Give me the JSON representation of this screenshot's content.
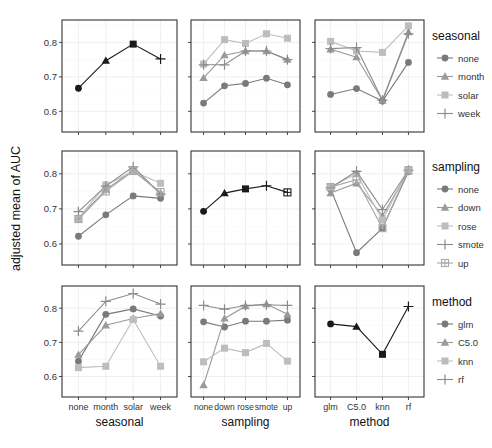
{
  "chart_data": {
    "type": "line",
    "title": "",
    "ylabel": "adjusted mean of AUC",
    "ylim": [
      0.54,
      0.865
    ],
    "yticks": [
      0.6,
      0.7,
      0.8
    ],
    "ytick_labels": [
      "0.6",
      "0.7",
      "0.8"
    ],
    "grid": true,
    "legend_position": "right",
    "factors": {
      "seasonal": [
        "none",
        "month",
        "solar",
        "week"
      ],
      "sampling": [
        "none",
        "down",
        "rose",
        "smote",
        "up"
      ],
      "method": [
        "glm",
        "C5.0",
        "knn",
        "rf"
      ]
    },
    "xlabels": [
      "seasonal",
      "sampling",
      "method"
    ],
    "legends": [
      {
        "title": "seasonal",
        "entries": [
          "none",
          "month",
          "solar",
          "week"
        ]
      },
      {
        "title": "sampling",
        "entries": [
          "none",
          "down",
          "rose",
          "smote",
          "up"
        ]
      },
      {
        "title": "method",
        "entries": [
          "glm",
          "C5.0",
          "knn",
          "rf"
        ]
      }
    ],
    "panels": [
      {
        "row": 0,
        "col": 0,
        "x_factor": "seasonal",
        "trace_factor": "seasonal",
        "main_effect": true,
        "series": [
          {
            "name": "main",
            "values": [
              0.667,
              0.747,
              0.795,
              0.752
            ]
          }
        ]
      },
      {
        "row": 0,
        "col": 1,
        "x_factor": "sampling",
        "trace_factor": "seasonal",
        "series": [
          {
            "name": "none",
            "values": [
              0.624,
              0.674,
              0.681,
              0.696,
              0.677
            ]
          },
          {
            "name": "month",
            "values": [
              0.697,
              0.763,
              0.775,
              0.775,
              0.75
            ]
          },
          {
            "name": "solar",
            "values": [
              0.737,
              0.808,
              0.797,
              0.825,
              0.812
            ]
          },
          {
            "name": "week",
            "values": [
              0.735,
              0.735,
              0.775,
              0.775,
              0.75
            ]
          }
        ]
      },
      {
        "row": 0,
        "col": 2,
        "x_factor": "method",
        "trace_factor": "seasonal",
        "series": [
          {
            "name": "none",
            "values": [
              0.649,
              0.666,
              0.63,
              0.742
            ]
          },
          {
            "name": "month",
            "values": [
              0.78,
              0.757,
              0.632,
              0.83
            ]
          },
          {
            "name": "solar",
            "values": [
              0.803,
              0.775,
              0.771,
              0.848
            ]
          },
          {
            "name": "week",
            "values": [
              0.782,
              0.785,
              0.632,
              0.825
            ]
          }
        ]
      },
      {
        "row": 1,
        "col": 0,
        "x_factor": "seasonal",
        "trace_factor": "sampling",
        "series": [
          {
            "name": "none",
            "values": [
              0.622,
              0.683,
              0.737,
              0.73
            ]
          },
          {
            "name": "down",
            "values": [
              0.672,
              0.755,
              0.81,
              0.745
            ]
          },
          {
            "name": "rose",
            "values": [
              0.673,
              0.768,
              0.807,
              0.773
            ]
          },
          {
            "name": "smote",
            "values": [
              0.692,
              0.765,
              0.82,
              0.742
            ]
          },
          {
            "name": "up",
            "values": [
              0.671,
              0.75,
              0.808,
              0.748
            ]
          }
        ]
      },
      {
        "row": 1,
        "col": 1,
        "x_factor": "sampling",
        "trace_factor": "sampling",
        "main_effect": true,
        "series": [
          {
            "name": "main",
            "values": [
              0.693,
              0.745,
              0.757,
              0.766,
              0.747
            ]
          }
        ]
      },
      {
        "row": 1,
        "col": 2,
        "x_factor": "method",
        "trace_factor": "sampling",
        "series": [
          {
            "name": "none",
            "values": [
              0.757,
              0.575,
              0.645,
              0.806
            ]
          },
          {
            "name": "down",
            "values": [
              0.745,
              0.773,
              0.68,
              0.807
            ]
          },
          {
            "name": "rose",
            "values": [
              0.762,
              0.8,
              0.668,
              0.812
            ]
          },
          {
            "name": "smote",
            "values": [
              0.76,
              0.807,
              0.698,
              0.81
            ]
          },
          {
            "name": "up",
            "values": [
              0.762,
              0.783,
              0.645,
              0.81
            ]
          }
        ]
      },
      {
        "row": 2,
        "col": 0,
        "x_factor": "seasonal",
        "trace_factor": "method",
        "series": [
          {
            "name": "glm",
            "values": [
              0.645,
              0.782,
              0.798,
              0.777
            ]
          },
          {
            "name": "C5.0",
            "values": [
              0.664,
              0.75,
              0.77,
              0.784
            ]
          },
          {
            "name": "knn",
            "values": [
              0.626,
              0.63,
              0.767,
              0.63
            ]
          },
          {
            "name": "rf",
            "values": [
              0.733,
              0.82,
              0.843,
              0.812
            ]
          }
        ]
      },
      {
        "row": 2,
        "col": 1,
        "x_factor": "sampling",
        "trace_factor": "method",
        "series": [
          {
            "name": "glm",
            "values": [
              0.76,
              0.745,
              0.762,
              0.762,
              0.765
            ]
          },
          {
            "name": "C5.0",
            "values": [
              0.575,
              0.77,
              0.806,
              0.812,
              0.782
            ]
          },
          {
            "name": "knn",
            "values": [
              0.643,
              0.683,
              0.67,
              0.697,
              0.645
            ]
          },
          {
            "name": "rf",
            "values": [
              0.808,
              0.797,
              0.808,
              0.81,
              0.808
            ]
          }
        ]
      },
      {
        "row": 2,
        "col": 2,
        "x_factor": "method",
        "trace_factor": "method",
        "main_effect": true,
        "series": [
          {
            "name": "main",
            "values": [
              0.754,
              0.746,
              0.665,
              0.805
            ]
          }
        ]
      }
    ]
  },
  "style": {
    "series_colors": [
      "#7a7a7a",
      "#9a9a9a",
      "#bdbdbd",
      "#8c8c8c",
      "#a8a8a8"
    ],
    "series_shapes": [
      "circle",
      "triangle",
      "square",
      "plus",
      "boxplus"
    ],
    "main_effect_color": "#1a1a1a",
    "panel_border": "#333333",
    "grid_color": "#ebebeb",
    "text_color": "#333333"
  }
}
